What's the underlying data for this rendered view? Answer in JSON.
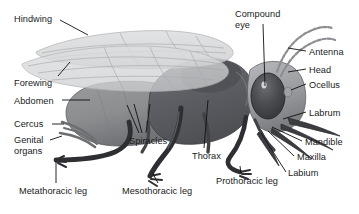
{
  "figure": {
    "background_color": "#ffffff",
    "text_color": "#1a1a1a",
    "leader_line_color": "#111111",
    "soft_leader_color": "#9a9a9a",
    "width": 359,
    "height": 214
  },
  "palette": {
    "wing_fill": "#d9dadb",
    "wing_edge": "#b4b6b8",
    "wing_vein": "#a9abad",
    "abdomen": "#8f9092",
    "abdomen_shadow": "#74767a",
    "thorax_dark": "#5e6064",
    "thorax_mid": "#6f7276",
    "head_mid": "#85878b",
    "head_light": "#b3b5b8",
    "eye_dark": "#3a3c40",
    "eye_highlight": "#e8e9ea",
    "leg_dark": "#2d2f32",
    "leg_mid": "#48494d",
    "outline": "#222326"
  },
  "labels": [
    {
      "id": "hindwing",
      "text": "Hindwing",
      "x": 14,
      "y": 14
    },
    {
      "id": "forewing",
      "text": "Forewing",
      "x": 14,
      "y": 78
    },
    {
      "id": "abdomen",
      "text": "Abdomen",
      "x": 14,
      "y": 96
    },
    {
      "id": "cercus",
      "text": "Cercus",
      "x": 14,
      "y": 120
    },
    {
      "id": "genital-organs",
      "text": "Genital\norgans",
      "x": 14,
      "y": 136
    },
    {
      "id": "metathoracic-leg",
      "text": "Metathoracic leg",
      "x": 19,
      "y": 186
    },
    {
      "id": "mesothoracic-leg",
      "text": "Mesothoracic leg",
      "x": 122,
      "y": 186
    },
    {
      "id": "spiracles",
      "text": "Spiracles",
      "x": 129,
      "y": 136
    },
    {
      "id": "thorax",
      "text": "Thorax",
      "x": 192,
      "y": 151
    },
    {
      "id": "prothoracic-leg",
      "text": "Prothoracic leg",
      "x": 216,
      "y": 176
    },
    {
      "id": "compound-eye",
      "text": "Compound\neye",
      "x": 235,
      "y": 9
    },
    {
      "id": "antenna",
      "text": "Antenna",
      "x": 309,
      "y": 47
    },
    {
      "id": "head",
      "text": "Head",
      "x": 309,
      "y": 65
    },
    {
      "id": "ocellus",
      "text": "Ocellus",
      "x": 309,
      "y": 80
    },
    {
      "id": "labrum",
      "text": "Labrum",
      "x": 309,
      "y": 108
    },
    {
      "id": "mandible",
      "text": "Mandible",
      "x": 305,
      "y": 137
    },
    {
      "id": "maxilla",
      "text": "Maxilla",
      "x": 297,
      "y": 152
    },
    {
      "id": "labium",
      "text": "Labium",
      "x": 288,
      "y": 168
    }
  ],
  "structures": [
    {
      "id": "hindwing",
      "name": "Hindwing"
    },
    {
      "id": "forewing",
      "name": "Forewing"
    },
    {
      "id": "abdomen",
      "name": "Abdomen"
    },
    {
      "id": "cercus",
      "name": "Cercus"
    },
    {
      "id": "genital-organs",
      "name": "Genital organs"
    },
    {
      "id": "metathoracic-leg",
      "name": "Metathoracic leg"
    },
    {
      "id": "mesothoracic-leg",
      "name": "Mesothoracic leg"
    },
    {
      "id": "prothoracic-leg",
      "name": "Prothoracic leg"
    },
    {
      "id": "spiracles",
      "name": "Spiracles"
    },
    {
      "id": "thorax",
      "name": "Thorax"
    },
    {
      "id": "compound-eye",
      "name": "Compound eye"
    },
    {
      "id": "antenna",
      "name": "Antenna"
    },
    {
      "id": "head",
      "name": "Head"
    },
    {
      "id": "ocellus",
      "name": "Ocellus"
    },
    {
      "id": "labrum",
      "name": "Labrum"
    },
    {
      "id": "mandible",
      "name": "Mandible"
    },
    {
      "id": "maxilla",
      "name": "Maxilla"
    },
    {
      "id": "labium",
      "name": "Labium"
    }
  ]
}
